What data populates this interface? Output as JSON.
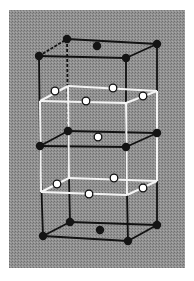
{
  "figure": {
    "colors": {
      "background_page": "#ffffff",
      "panel": "#8c8c8c",
      "black_frame": "#111111",
      "white_frame": "#f4f4f4",
      "filled_atom": "#141414",
      "open_atom_fill": "#ffffff",
      "open_atom_stroke": "#111111"
    },
    "panel": {
      "x": 9,
      "y": 10,
      "w": 176,
      "h": 258
    },
    "black_layers": [
      {
        "name": "top",
        "fl": [
          39,
          56
        ],
        "bl": [
          67,
          39
        ],
        "br": [
          157,
          44
        ],
        "fr": [
          126,
          58
        ],
        "center": [
          97,
          46
        ],
        "center_type": "filled"
      },
      {
        "name": "middle",
        "fl": [
          40,
          146
        ],
        "bl": [
          68,
          131
        ],
        "br": [
          157,
          133
        ],
        "fr": [
          126,
          147
        ],
        "center": [
          98,
          137
        ],
        "center_type": "open"
      },
      {
        "name": "bottom",
        "fl": [
          43,
          236
        ],
        "bl": [
          70,
          222
        ],
        "br": [
          157,
          225
        ],
        "fr": [
          128,
          241
        ],
        "center": [
          100,
          230
        ],
        "center_type": "filled"
      }
    ],
    "white_box": {
      "top": {
        "fl": [
          40,
          101
        ],
        "bl": [
          68,
          86
        ],
        "br": [
          157,
          91
        ],
        "fr": [
          126,
          103
        ]
      },
      "bottom": {
        "fl": [
          41,
          192
        ],
        "bl": [
          69,
          178
        ],
        "br": [
          157,
          181
        ],
        "fr": [
          127,
          195
        ]
      },
      "open_atoms_top": [
        [
          55,
          91
        ],
        [
          113,
          88
        ],
        [
          86,
          101
        ],
        [
          143,
          96
        ]
      ],
      "open_atoms_bottom": [
        [
          57,
          184
        ],
        [
          114,
          178
        ],
        [
          89,
          194
        ],
        [
          143,
          188
        ]
      ]
    }
  }
}
